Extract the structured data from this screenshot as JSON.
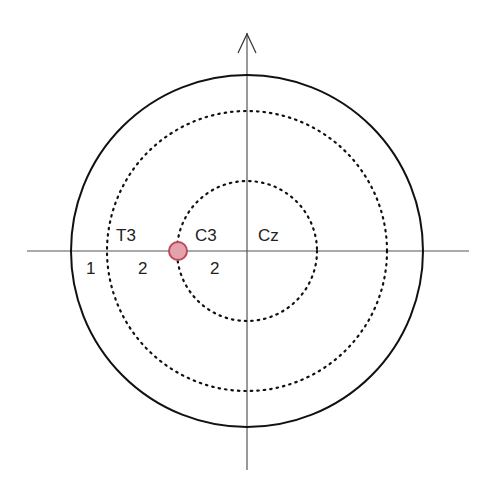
{
  "diagram": {
    "title": "",
    "labels": {
      "t3": "T3",
      "c3": "C3",
      "cz": "Cz",
      "dist_outer": "1",
      "dist_mid": "2",
      "dist_inner": "2"
    },
    "colors": {
      "axis": "#555555",
      "circle": "#111111",
      "marker_fill": "#e3a3ad",
      "marker_stroke": "#c0485b"
    }
  }
}
